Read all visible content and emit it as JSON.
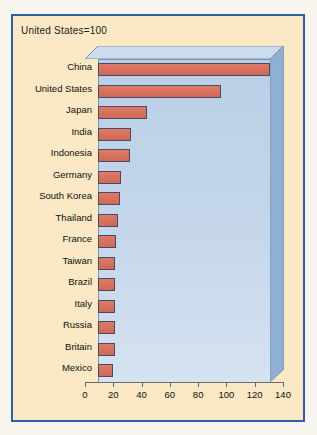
{
  "figure": {
    "caption": "United States=100",
    "panel_border_color": "#2f5fa8",
    "panel_background": "#fbe8c4",
    "bar_color": "#d9735e",
    "plot_background": "#c3d5ea"
  },
  "chart_data": {
    "type": "bar",
    "orientation": "horizontal",
    "title": "United States=100",
    "xlabel": "",
    "ylabel": "",
    "xlim": [
      0,
      140
    ],
    "xticks": [
      0,
      20,
      40,
      60,
      80,
      100,
      120,
      140
    ],
    "grid": false,
    "legend": false,
    "categories": [
      "China",
      "United States",
      "Japan",
      "India",
      "Indonesia",
      "Germany",
      "South Korea",
      "Thailand",
      "France",
      "Taiwan",
      "Brazil",
      "Italy",
      "Russia",
      "Britain",
      "Mexico"
    ],
    "values": [
      140,
      100,
      40,
      27,
      26,
      19,
      18,
      16,
      15,
      14,
      14,
      14,
      14,
      14,
      12
    ]
  }
}
